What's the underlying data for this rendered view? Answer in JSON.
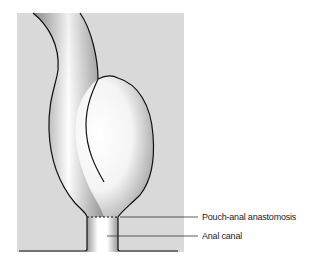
{
  "figure": {
    "panel_color": "#d9d9d9",
    "outline_color": "#111111",
    "labels": [
      {
        "id": "pouch-anal-anastomosis",
        "text": "Pouch-anal anastomosis"
      },
      {
        "id": "anal-canal",
        "text": "Anal canal"
      }
    ]
  }
}
